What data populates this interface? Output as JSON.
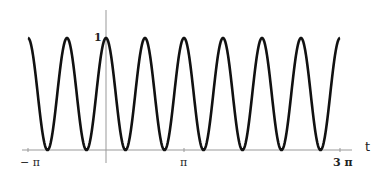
{
  "chart_data": {
    "type": "line",
    "title": "",
    "xlabel": "t",
    "ylabel": "",
    "function": "cos^2(2t)",
    "xlim": [
      -3.14159,
      9.42478
    ],
    "ylim": [
      0,
      1
    ],
    "x_ticks": [
      {
        "value": -3.14159,
        "label": "− π"
      },
      {
        "value": 3.14159,
        "label": "π"
      },
      {
        "value": 9.42478,
        "label": "3 π"
      }
    ],
    "y_ticks": [
      {
        "value": 1,
        "label": "1"
      }
    ],
    "series": [
      {
        "name": "curve",
        "color": "#111111",
        "peaks_at": "t = kπ/2",
        "zeros_at": "t = π/4 + kπ/2",
        "period": 1.5708
      }
    ],
    "grid": false,
    "legend": null
  },
  "labels": {
    "x_axis": "t",
    "y_tick_1": "1",
    "x_tick_neg_pi": "− π",
    "x_tick_pi": "π",
    "x_tick_3pi": "3 π"
  }
}
